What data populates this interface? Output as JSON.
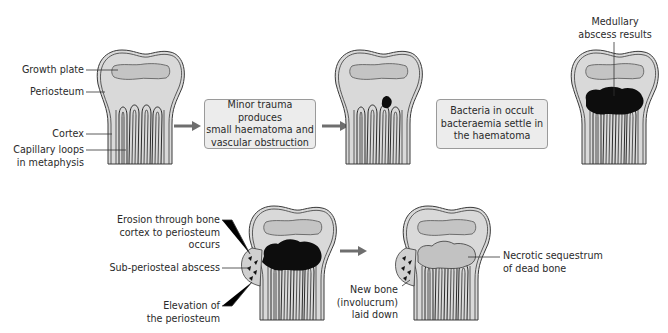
{
  "diagram": {
    "type": "process-flow",
    "colors": {
      "bone_fill": "#d9d9d9",
      "outline": "#3a3a3a",
      "growth_plate": "#c4c4c4",
      "abscess": "#0d0d0d",
      "sequestrum": "#c2c2c2",
      "arrow": "#6e6e6e",
      "box_fill": "#ececec"
    },
    "stage1_labels": {
      "growth_plate": "Growth plate",
      "periosteum": "Periosteum",
      "cortex": "Cortex",
      "capillary_line1": "Capillary loops",
      "capillary_line2": "in metaphysis"
    },
    "steps": [
      {
        "line1": "Minor trauma produces",
        "line2": "small haematoma and",
        "line3": "vascular obstruction"
      },
      {
        "line1": "Bacteria in occult",
        "line2": "bacteraemia settle in",
        "line3": "the haematoma"
      }
    ],
    "stage3_label": {
      "line1": "Medullary",
      "line2": "abscess results"
    },
    "stage4_labels": {
      "erosion_line1": "Erosion through bone",
      "erosion_line2": "cortex to periosteum",
      "erosion_line3": "occurs",
      "subperiosteal": "Sub-periosteal abscess",
      "elevation_line1": "Elevation of",
      "elevation_line2": "the periosteum"
    },
    "stage5_labels": {
      "newbone_line1": "New bone",
      "newbone_line2": "(involucrum)",
      "newbone_line3": "laid down",
      "necrotic_line1": "Necrotic sequestrum",
      "necrotic_line2": "of dead bone"
    }
  }
}
